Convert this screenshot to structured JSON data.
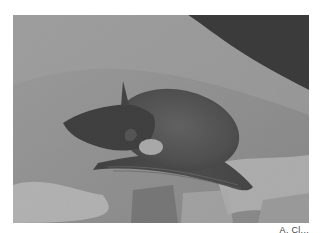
{
  "photo": {
    "subject": "bat resting on rock",
    "alt": "Black and white photograph of a bat lying on a rock surface",
    "palette": {
      "rock_light": "#c8c8c8",
      "rock_mid": "#9c9c9c",
      "rock_dark": "#6e6e6e",
      "background_dark": "#141414",
      "bat_body": "#3a3a3a",
      "bat_wing": "#262626"
    }
  },
  "caption": {
    "credit": "A. Cl..."
  }
}
